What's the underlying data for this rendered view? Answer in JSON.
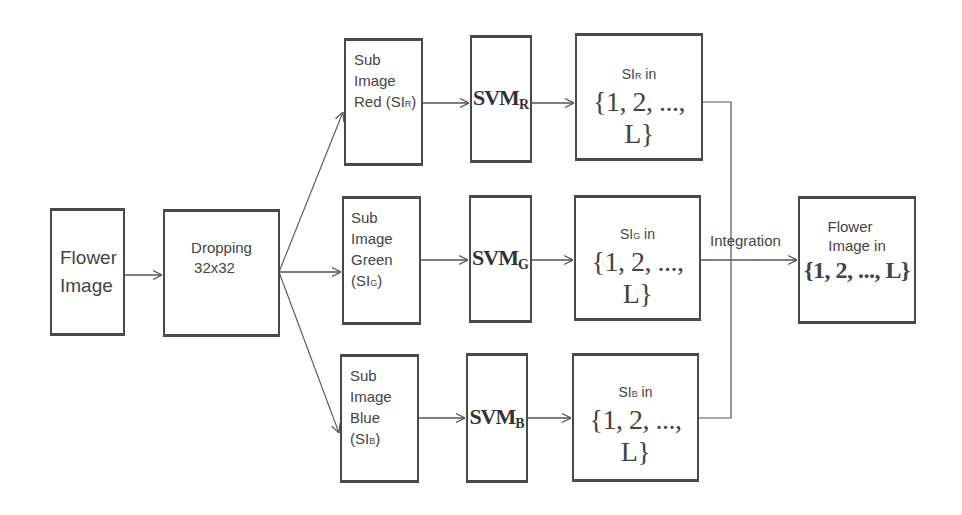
{
  "diagram": {
    "input": {
      "line1": "Flower",
      "line2": "Image"
    },
    "preprocess": {
      "line1": "Dropping",
      "line2": "32x32"
    },
    "channels": [
      {
        "sub_image": {
          "l1": "Sub",
          "l2": "Image",
          "l3": "Red (SI",
          "l3_sub": "R",
          "l3_end": ")"
        },
        "svm": {
          "name": "SVM",
          "sub": "R"
        },
        "result": {
          "prefix": "SI",
          "sub": "R",
          "suffix": " in",
          "set": "{1, 2, ..., L}"
        }
      },
      {
        "sub_image": {
          "l1": "Sub",
          "l2": "Image",
          "l3": "Green",
          "l4": "(SI",
          "l4_sub": "G",
          "l4_end": ")"
        },
        "svm": {
          "name": "SVM",
          "sub": "G"
        },
        "result": {
          "prefix": "SI",
          "sub": "G",
          "suffix": " in",
          "set": "{1, 2, ..., L}"
        }
      },
      {
        "sub_image": {
          "l1": "Sub",
          "l2": "Image",
          "l3": "Blue",
          "l4": "(SI",
          "l4_sub": "B",
          "l4_end": ")"
        },
        "svm": {
          "name": "SVM",
          "sub": "B"
        },
        "result": {
          "prefix": "SI",
          "sub": "B",
          "suffix": " in",
          "set": "{1, 2, ..., L}"
        }
      }
    ],
    "integration_label": "Integration",
    "output": {
      "line1": "Flower",
      "line2": "Image in",
      "set": "{1, 2, ..., L}"
    }
  },
  "colors": {
    "line": "#555555",
    "border": "#4a4a4a",
    "text": "#444444"
  }
}
